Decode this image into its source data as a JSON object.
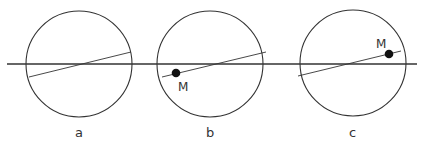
{
  "diagram": {
    "colors": {
      "stroke": "#333333",
      "point": "#111111",
      "background": "#ffffff"
    },
    "panels": [
      {
        "label": "a",
        "has_point": false,
        "point_label": ""
      },
      {
        "label": "b",
        "has_point": true,
        "point_label": "M"
      },
      {
        "label": "c",
        "has_point": true,
        "point_label": "M"
      }
    ]
  }
}
